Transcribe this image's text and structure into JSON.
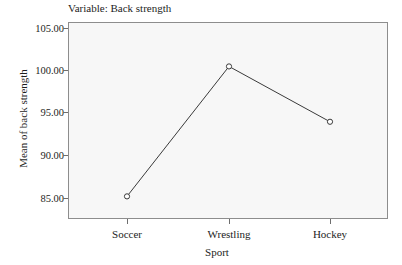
{
  "chart_data": {
    "type": "line",
    "title": "Variable: Back strength",
    "xlabel": "Sport",
    "ylabel": "Mean of back strength",
    "categories": [
      "Soccer",
      "Wrestling",
      "Hockey"
    ],
    "values": [
      85.7,
      101.2,
      94.6
    ],
    "series": [
      {
        "name": "Mean of back strength",
        "values": [
          85.7,
          101.2,
          94.6
        ]
      }
    ],
    "ylim": [
      83.0,
      106.5
    ],
    "yticks": [
      85,
      90,
      95,
      100,
      105
    ],
    "ytick_labels": [
      "85.00",
      "90.00",
      "95.00",
      "100.00",
      "105.00"
    ],
    "grid": false,
    "legend": "none",
    "marker": "open-circle",
    "line_color": "#3a3a3a",
    "plot_background": "#f7f7f7",
    "frame_color": "#8d8d8d"
  },
  "axes": {
    "y_tick_0": "85.00",
    "y_tick_1": "90.00",
    "y_tick_2": "95.00",
    "y_tick_3": "100.00",
    "y_tick_4": "105.00",
    "x_cat_0": "Soccer",
    "x_cat_1": "Wrestling",
    "x_cat_2": "Hockey"
  }
}
